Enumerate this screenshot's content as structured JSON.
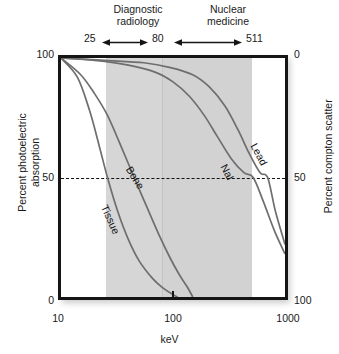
{
  "chart_data": {
    "type": "line",
    "title": "",
    "xlabel": "keV",
    "ylabel": "Percent photoelectric absorption",
    "ylabel_right": "Percent compton scatter",
    "xscale": "log",
    "xlim": [
      10,
      1000
    ],
    "ylim": [
      0,
      100
    ],
    "ylim_right": [
      100,
      0
    ],
    "xticks": [
      "10",
      "100",
      "1000"
    ],
    "yticks_left": [
      "100",
      "50",
      "0"
    ],
    "yticks_right": [
      "0",
      "50",
      "100"
    ],
    "grid": false,
    "legend": "inline-curve-labels",
    "annotations": {
      "reference_line": {
        "label": "50",
        "y": 50,
        "style": "dashed"
      },
      "ranges": [
        {
          "name": "Diagnostic radiology",
          "from_kev": 25,
          "to_kev": 80
        },
        {
          "name": "Nuclear medicine",
          "from_kev": 80,
          "to_kev": 511
        }
      ],
      "range_markers": [
        "25",
        "80",
        "511"
      ]
    },
    "series": [
      {
        "name": "Tissue",
        "points": [
          {
            "kev": 10,
            "pct": 100
          },
          {
            "kev": 14,
            "pct": 92
          },
          {
            "kev": 18,
            "pct": 78
          },
          {
            "kev": 22,
            "pct": 63
          },
          {
            "kev": 26,
            "pct": 50
          },
          {
            "kev": 32,
            "pct": 36
          },
          {
            "kev": 40,
            "pct": 24
          },
          {
            "kev": 50,
            "pct": 15
          },
          {
            "kev": 65,
            "pct": 8
          },
          {
            "kev": 80,
            "pct": 4
          },
          {
            "kev": 100,
            "pct": 1
          },
          {
            "kev": 110,
            "pct": 0
          }
        ]
      },
      {
        "name": "Bone",
        "points": [
          {
            "kev": 10,
            "pct": 100
          },
          {
            "kev": 15,
            "pct": 93
          },
          {
            "kev": 20,
            "pct": 85
          },
          {
            "kev": 26,
            "pct": 76
          },
          {
            "kev": 33,
            "pct": 65
          },
          {
            "kev": 45,
            "pct": 50
          },
          {
            "kev": 58,
            "pct": 38
          },
          {
            "kev": 75,
            "pct": 26
          },
          {
            "kev": 95,
            "pct": 16
          },
          {
            "kev": 115,
            "pct": 9
          },
          {
            "kev": 135,
            "pct": 4
          },
          {
            "kev": 150,
            "pct": 0
          }
        ]
      },
      {
        "name": "NaI",
        "points": [
          {
            "kev": 10,
            "pct": 100
          },
          {
            "kev": 20,
            "pct": 99
          },
          {
            "kev": 40,
            "pct": 97
          },
          {
            "kev": 70,
            "pct": 94
          },
          {
            "kev": 100,
            "pct": 90
          },
          {
            "kev": 140,
            "pct": 84
          },
          {
            "kev": 190,
            "pct": 76
          },
          {
            "kev": 250,
            "pct": 67
          },
          {
            "kev": 330,
            "pct": 58
          },
          {
            "kev": 430,
            "pct": 52
          },
          {
            "kev": 520,
            "pct": 50
          },
          {
            "kev": 640,
            "pct": 40
          },
          {
            "kev": 800,
            "pct": 28
          },
          {
            "kev": 1000,
            "pct": 18
          }
        ]
      },
      {
        "name": "Lead",
        "points": [
          {
            "kev": 10,
            "pct": 100
          },
          {
            "kev": 25,
            "pct": 99
          },
          {
            "kev": 55,
            "pct": 98
          },
          {
            "kev": 95,
            "pct": 96
          },
          {
            "kev": 150,
            "pct": 93
          },
          {
            "kev": 210,
            "pct": 88
          },
          {
            "kev": 290,
            "pct": 80
          },
          {
            "kev": 380,
            "pct": 70
          },
          {
            "kev": 480,
            "pct": 60
          },
          {
            "kev": 600,
            "pct": 52
          },
          {
            "kev": 700,
            "pct": 50
          },
          {
            "kev": 820,
            "pct": 36
          },
          {
            "kev": 1000,
            "pct": 22
          }
        ]
      }
    ]
  },
  "header": {
    "diagnostic_label": "Diagnostic\nradiology",
    "diagnostic_line1": "Diagnostic",
    "diagnostic_line2": "radiology",
    "nuclear_line1": "Nuclear",
    "nuclear_line2": "medicine",
    "marker_low": "25",
    "marker_mid": "80",
    "marker_high": "511"
  },
  "axes": {
    "left_title_line1": "Percent photoelectric",
    "left_title_line2": "absorption",
    "right_title": "Percent compton scatter",
    "x_title": "keV",
    "left_100": "100",
    "left_50": "50",
    "left_0": "0",
    "right_0": "0",
    "right_50": "50",
    "right_100": "100",
    "x_10": "10",
    "x_100": "100",
    "x_1000": "1000"
  },
  "curve_labels": {
    "tissue": "Tissue",
    "bone": "Bone",
    "nai": "NaI",
    "lead": "Lead"
  },
  "colors": {
    "frame": "#151515",
    "curve": "#6e6e6e",
    "band_diagnostic": "#d6d6d6",
    "band_nuclear": "#d2d2d2",
    "background": "#ffffff",
    "text": "#1a1a1a"
  }
}
